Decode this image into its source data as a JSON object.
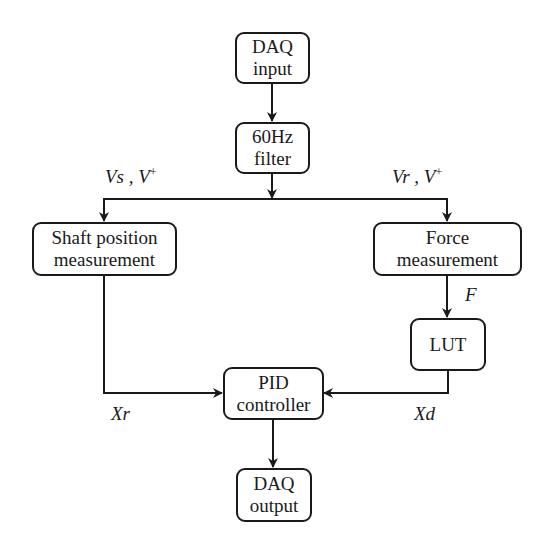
{
  "diagram": {
    "type": "flowchart",
    "nodes": [
      {
        "id": "daq_input",
        "lines": [
          "DAQ",
          "input"
        ]
      },
      {
        "id": "filter",
        "lines": [
          "60Hz",
          "filter"
        ]
      },
      {
        "id": "shaft",
        "lines": [
          "Shaft position",
          "measurement"
        ]
      },
      {
        "id": "force",
        "lines": [
          "Force",
          "measurement"
        ]
      },
      {
        "id": "lut",
        "lines": [
          "LUT"
        ]
      },
      {
        "id": "pid",
        "lines": [
          "PID",
          "controller"
        ]
      },
      {
        "id": "daq_output",
        "lines": [
          "DAQ",
          "output"
        ]
      }
    ],
    "edges": [
      {
        "from": "daq_input",
        "to": "filter",
        "label": ""
      },
      {
        "from": "filter",
        "to": "shaft",
        "label": "Vs , V+"
      },
      {
        "from": "filter",
        "to": "force",
        "label": "Vr , V+"
      },
      {
        "from": "force",
        "to": "lut",
        "label": "F"
      },
      {
        "from": "shaft",
        "to": "pid",
        "label": "Xr"
      },
      {
        "from": "lut",
        "to": "pid",
        "label": "Xd"
      },
      {
        "from": "pid",
        "to": "daq_output",
        "label": ""
      }
    ]
  },
  "labels": {
    "vs_main": "Vs , V",
    "vs_sup": "+",
    "vr_main": "Vr , V",
    "vr_sup": "+",
    "f": "F",
    "xr": "Xr",
    "xd": "Xd"
  },
  "colors": {
    "stroke": "#1a1a1a",
    "background": "#ffffff"
  }
}
